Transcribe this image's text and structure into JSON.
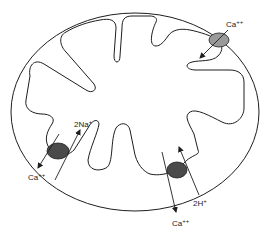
{
  "diagram": {
    "colors": {
      "stroke": "#1e1e1e",
      "background": "#ffffff",
      "transporter_light": "#9a9a9a",
      "transporter_dark": "#4a4a4a"
    },
    "transporters": [
      {
        "id": "top-right",
        "type": "uniporter",
        "labels": [
          {
            "base": "Ca",
            "sup": "++"
          }
        ]
      },
      {
        "id": "left",
        "type": "Na-Ca exchanger",
        "labels": [
          {
            "base": "2Na",
            "sup": "+"
          },
          {
            "base": "Ca",
            "sup": "++"
          }
        ]
      },
      {
        "id": "bottom",
        "type": "H-Ca exchanger",
        "labels": [
          {
            "base": "2H",
            "sup": "+"
          },
          {
            "base": "Ca",
            "sup": "++"
          }
        ]
      }
    ]
  }
}
